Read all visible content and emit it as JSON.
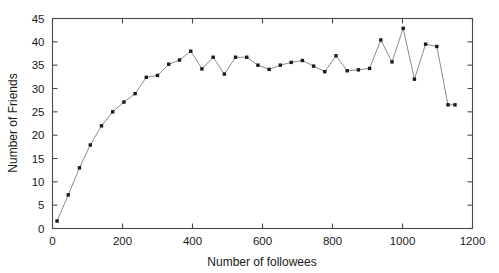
{
  "chart_data": {
    "type": "line",
    "title": "",
    "xlabel": "Number of followees",
    "ylabel": "Number of Friends",
    "xlim": [
      0,
      1200
    ],
    "ylim": [
      0,
      45
    ],
    "xticks": [
      0,
      200,
      400,
      600,
      800,
      1000,
      1200
    ],
    "yticks": [
      0,
      5,
      10,
      15,
      20,
      25,
      30,
      35,
      40,
      45
    ],
    "grid": false,
    "legend": null,
    "marker": "square",
    "marker_color": "#1a1a1a",
    "line_color": "#8c8c8c",
    "series": [
      {
        "name": "Number of Friends",
        "x": [
          13,
          45,
          77,
          108,
          140,
          172,
          204,
          236,
          268,
          300,
          332,
          363,
          395,
          427,
          459,
          491,
          523,
          555,
          587,
          619,
          651,
          682,
          714,
          746,
          778,
          810,
          842,
          874,
          906,
          938,
          970,
          1002,
          1034,
          1066,
          1098,
          1130,
          1150
        ],
        "y": [
          1.6,
          7.2,
          13.0,
          17.9,
          22.0,
          25.0,
          27.1,
          28.9,
          32.4,
          32.8,
          35.2,
          36.1,
          38.0,
          34.2,
          36.7,
          33.1,
          36.7,
          36.7,
          35.0,
          34.1,
          35.0,
          35.6,
          36.0,
          34.8,
          33.6,
          37.0,
          33.8,
          34.0,
          34.3,
          40.4,
          35.7,
          42.9,
          32.0,
          39.5,
          39.0,
          26.5,
          26.5
        ]
      }
    ]
  },
  "axes": {
    "x_tick_labels": [
      "0",
      "200",
      "400",
      "600",
      "800",
      "1000",
      "1200"
    ],
    "y_tick_labels": [
      "0",
      "5",
      "10",
      "15",
      "20",
      "25",
      "30",
      "35",
      "40",
      "45"
    ],
    "x_axis_title": "Number of followees",
    "y_axis_title": "Number of Friends"
  }
}
